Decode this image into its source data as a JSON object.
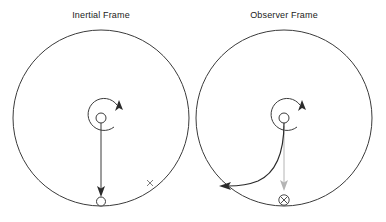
{
  "figure": {
    "caption_left": "Inertial Frame",
    "caption_right": "Observer Frame",
    "stroke_color": "#3b3b3b",
    "ghost_color": "#b4b4b4",
    "background": "#ffffff"
  },
  "panels": [
    {
      "id": "inertial",
      "title": "Inertial Frame",
      "center": {
        "x": 101,
        "y": 118
      },
      "radius": 88,
      "hub": {
        "x": 101,
        "y": 118,
        "r": 5
      },
      "spin_arrow": {
        "direction": "counter-clockwise",
        "tip": {
          "x": 119,
          "y": 106
        }
      },
      "trajectory": {
        "type": "straight",
        "from": {
          "x": 101,
          "y": 118
        },
        "to": {
          "x": 101,
          "y": 196
        }
      },
      "ball": {
        "x": 101,
        "y": 201,
        "r": 4.5
      },
      "mark": {
        "symbol": "x",
        "x": 150,
        "y": 183
      }
    },
    {
      "id": "observer",
      "title": "Observer Frame",
      "center": {
        "x": 284,
        "y": 118
      },
      "radius": 88,
      "hub": {
        "x": 284,
        "y": 118,
        "r": 5
      },
      "spin_arrow": {
        "direction": "counter-clockwise",
        "tip": {
          "x": 302,
          "y": 106
        }
      },
      "trajectory": {
        "type": "curved",
        "from": {
          "x": 284,
          "y": 118
        },
        "to": {
          "x": 222,
          "y": 186
        }
      },
      "ghost_trajectory": {
        "type": "straight",
        "from": {
          "x": 284,
          "y": 126
        },
        "to": {
          "x": 284,
          "y": 190
        }
      },
      "mark": {
        "symbol": "circled-x",
        "x": 284,
        "y": 200,
        "r": 5
      }
    }
  ]
}
